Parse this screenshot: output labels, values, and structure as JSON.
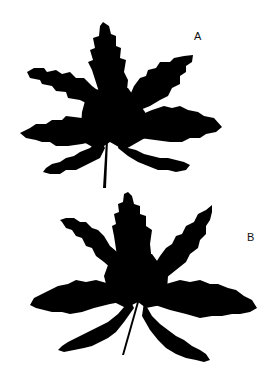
{
  "figure": {
    "panels": [
      {
        "label": "A",
        "description": "black silhouette of a palmately lobed leaf with serrated margins and petiole"
      },
      {
        "label": "B",
        "description": "black silhouette of a more deeply lobed palmate leaf with serrated margins and thin petiole"
      }
    ],
    "colors": {
      "background": "#ffffff",
      "silhouette": "#000000"
    }
  }
}
